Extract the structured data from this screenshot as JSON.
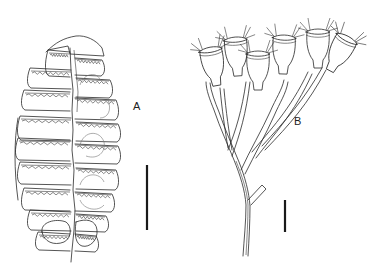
{
  "figure": {
    "panels": [
      {
        "id": "A",
        "label": "A",
        "subject": "colony-outline-specimen",
        "has_scale_bar": true
      },
      {
        "id": "B",
        "label": "B",
        "subject": "branching-hydroid-specimen",
        "has_scale_bar": true
      }
    ],
    "colors": {
      "line": "#2a2a2a",
      "background": "#ffffff",
      "scale_bar": "#1a1a1a"
    }
  }
}
